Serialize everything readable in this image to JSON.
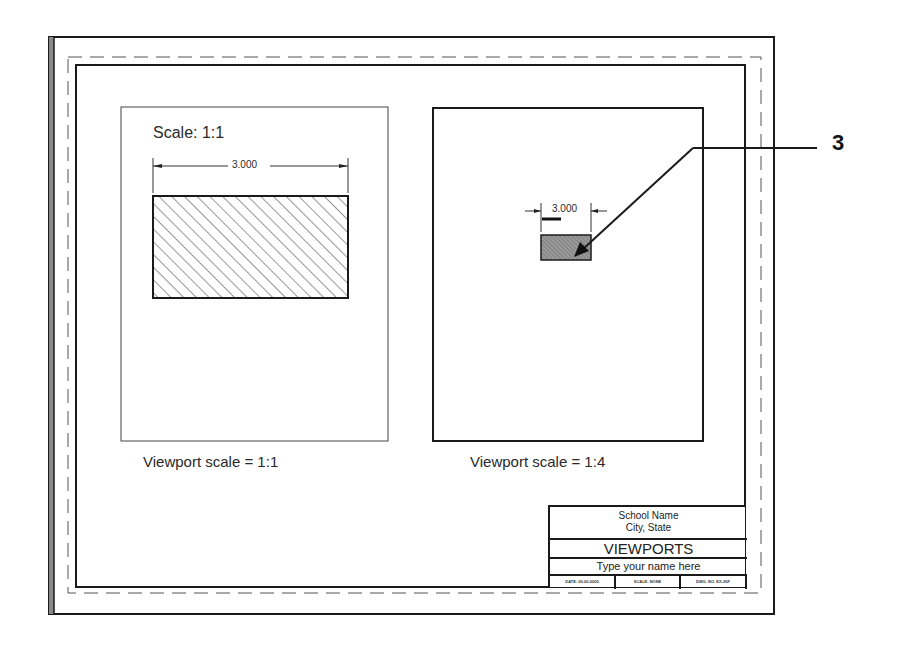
{
  "drawing": {
    "callout_number": "3",
    "left_viewport": {
      "scale_label": "Scale: 1:1",
      "dimension": "3.000",
      "caption": "Viewport scale = 1:1"
    },
    "right_viewport": {
      "dimension": "3.000",
      "caption": "Viewport scale = 1:4"
    }
  },
  "title_block": {
    "school": "School Name",
    "city": "City, State",
    "title": "VIEWPORTS",
    "name": "Type your name here",
    "date": "DATE: 00-00-0000",
    "scale": "SCALE: NONE",
    "dwg_no": "DWG. NO. EX-26F"
  },
  "colors": {
    "line": "#1a1a1a",
    "hatch": "#333333",
    "paper": "#ffffff"
  }
}
